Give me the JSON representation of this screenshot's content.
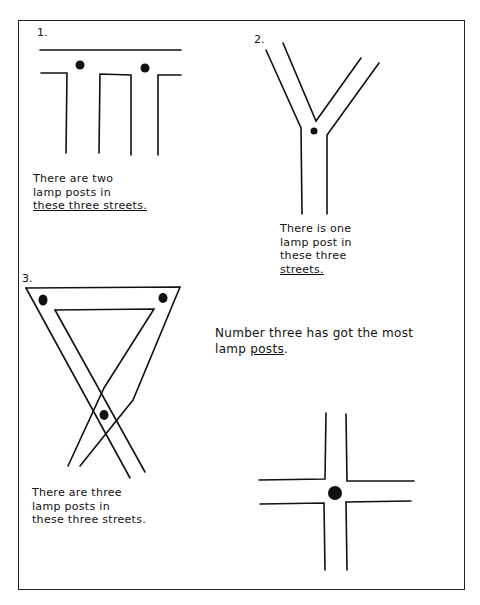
{
  "diagrams": [
    {
      "number": "1.",
      "caption_lines": [
        "There are two",
        "lamp posts in",
        "these three streets."
      ],
      "caption_underlined": "streets",
      "lamp_posts": 2,
      "shape": "T-junctions"
    },
    {
      "number": "2.",
      "caption_lines": [
        "There is one",
        "lamp post in",
        "these three",
        "streets."
      ],
      "caption_underlined": "streets",
      "lamp_posts": 1,
      "shape": "Y-junction"
    },
    {
      "number": "3.",
      "caption_lines": [
        "There are three",
        "lamp posts in",
        "these three streets."
      ],
      "caption_underlined": "three, posts, streets",
      "lamp_posts": 3,
      "shape": "triangle crossing"
    },
    {
      "number": "",
      "caption_lines": [],
      "lamp_posts": 1,
      "shape": "crossroads"
    }
  ],
  "conclusion": {
    "line1": "Number three has got the most",
    "line2_prefix": "lamp ",
    "line2_underlined": "posts",
    "line2_suffix": "."
  },
  "colors": {
    "ink": "#111111",
    "paper": "#ffffff"
  }
}
